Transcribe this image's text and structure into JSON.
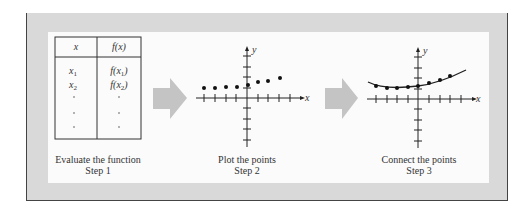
{
  "diagram": {
    "steps": [
      {
        "title": "Evaluate the function",
        "label": "Step 1",
        "table": {
          "headers": [
            "x",
            "f(x)"
          ],
          "rows": [
            [
              "x1",
              "f(x1)"
            ],
            [
              "x2",
              "f(x2)"
            ],
            [
              "·",
              "·"
            ],
            [
              "·",
              "·"
            ],
            [
              "·",
              "·"
            ]
          ]
        }
      },
      {
        "title": "Plot the points",
        "label": "Step 2",
        "axes": {
          "x_label": "x",
          "y_label": "y"
        }
      },
      {
        "title": "Connect the points",
        "label": "Step 3",
        "axes": {
          "x_label": "x",
          "y_label": "y"
        }
      }
    ],
    "arrows": [
      "step1-to-step2",
      "step2-to-step3"
    ],
    "colors": {
      "frame": "#d9d9d9",
      "panel": "#fbfbfb",
      "arrow": "#c4c4c4",
      "ink": "#222222"
    }
  }
}
